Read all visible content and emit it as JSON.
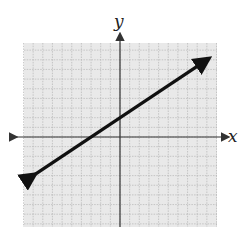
{
  "chart_data": {
    "type": "line",
    "title": "",
    "xlabel": "x",
    "ylabel": "y",
    "xlim": [
      -10,
      10
    ],
    "ylim": [
      -10,
      10
    ],
    "grid": true,
    "legend": null,
    "series": [
      {
        "name": "line",
        "equation": "y = (2/3)x + 2",
        "slope": 0.6667,
        "y_intercept": 2,
        "x_intercept": -3,
        "x": [
          -9,
          -3,
          0,
          9
        ],
        "values": [
          -4,
          0,
          2,
          8
        ],
        "arrows_both_ends": true
      }
    ]
  },
  "axes": {
    "x_label": "x",
    "y_label": "y"
  },
  "colors": {
    "grid_background": "#e9e9e9",
    "grid_lines": "#b5b5b5",
    "axis": "#333333",
    "line": "#111111"
  }
}
